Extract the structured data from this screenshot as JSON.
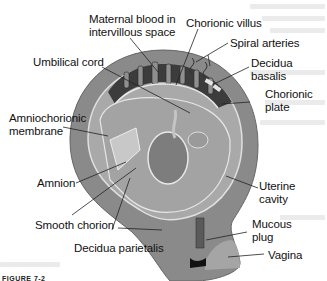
{
  "figure": {
    "caption": "FIGURE 7-2",
    "labels": {
      "maternal_blood_line1": "Maternal blood in",
      "maternal_blood_line2": "intervillous space",
      "chorionic_villus": "Chorionic villus",
      "spiral_arteries": "Spiral arteries",
      "decidua_basalis_line1": "Decidua",
      "decidua_basalis_line2": "basalis",
      "umbilical_cord": "Umbilical cord",
      "chorionic_plate_line1": "Chorionic",
      "chorionic_plate_line2": "plate",
      "amniochorionic_line1": "Amniochorionic",
      "amniochorionic_line2": "membrane",
      "amnion": "Amnion",
      "uterine_cavity_line1": "Uterine",
      "uterine_cavity_line2": "cavity",
      "smooth_chorion": "Smooth chorion",
      "mucous_plug_line1": "Mucous",
      "mucous_plug_line2": "plug",
      "decidua_parietalis": "Decidua parietalis",
      "vagina": "Vagina"
    },
    "colors": {
      "uterine_wall": "#8a8a8a",
      "cavity": "#a9a9a9",
      "placenta": "#3c3c3c",
      "membrane": "#d8d8d8",
      "leader_line": "#222222",
      "label_text": "#111111"
    }
  }
}
